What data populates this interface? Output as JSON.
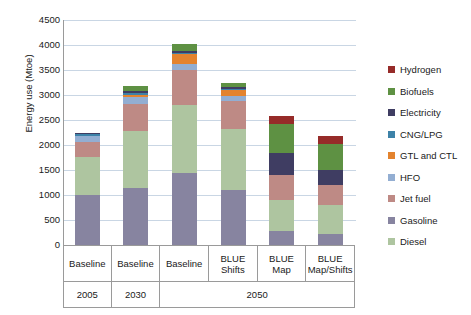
{
  "chart_data": {
    "type": "bar",
    "stacked": true,
    "title": "",
    "xlabel": "",
    "ylabel": "Energy use (Mtoe)",
    "ylim": [
      0,
      4500
    ],
    "ytick_step": 500,
    "yticks": [
      4500,
      4000,
      3500,
      3000,
      2500,
      2000,
      1500,
      1000,
      500,
      0
    ],
    "grid": true,
    "legend_position": "right",
    "categories": [
      "Baseline",
      "Baseline",
      "Baseline",
      "BLUE Shifts",
      "BLUE Map",
      "BLUE Map/Shifts"
    ],
    "category_lines": [
      [
        "Baseline"
      ],
      [
        "Baseline"
      ],
      [
        "Baseline"
      ],
      [
        "BLUE",
        "Shifts"
      ],
      [
        "BLUE",
        "Map"
      ],
      [
        "BLUE",
        "Map/Shifts"
      ]
    ],
    "group_labels": [
      {
        "label": "2005",
        "span": 1
      },
      {
        "label": "2030",
        "span": 1
      },
      {
        "label": "2050",
        "span": 4
      }
    ],
    "series": [
      {
        "name": "Diesel",
        "color": "#aec5a0",
        "values": [
          760,
          1130,
          1350,
          1220,
          610,
          570
        ]
      },
      {
        "name": "Gasoline",
        "color": "#8784a0",
        "values": [
          1000,
          1150,
          1450,
          1100,
          290,
          230
        ]
      },
      {
        "name": "Jet fuel",
        "color": "#be8a85",
        "values": [
          300,
          550,
          700,
          560,
          500,
          400
        ]
      },
      {
        "name": "HFO",
        "color": "#93aed2",
        "values": [
          130,
          130,
          120,
          110,
          0,
          0
        ]
      },
      {
        "name": "GTL and CTL",
        "color": "#e3832e",
        "values": [
          0,
          40,
          210,
          120,
          0,
          0
        ]
      },
      {
        "name": "CNG/LPG",
        "color": "#3d82a8",
        "values": [
          35,
          50,
          20,
          20,
          0,
          0
        ]
      },
      {
        "name": "Electricity",
        "color": "#3f3d62",
        "values": [
          20,
          35,
          40,
          40,
          450,
          300
        ]
      },
      {
        "name": "Biofuels",
        "color": "#5e9143",
        "values": [
          0,
          105,
          130,
          80,
          580,
          530
        ]
      },
      {
        "name": "Hydrogen",
        "color": "#962b29",
        "values": [
          0,
          0,
          0,
          0,
          150,
          150
        ]
      }
    ],
    "totals": [
      2245,
      3190,
      4020,
      3250,
      2580,
      2180
    ],
    "stack_order_bottom_to_top": [
      "Gasoline",
      "Diesel",
      "Jet fuel",
      "HFO",
      "GTL and CTL",
      "CNG/LPG",
      "Electricity",
      "Biofuels",
      "Hydrogen"
    ],
    "legend_entries": [
      {
        "label": "Hydrogen",
        "color": "#962b29"
      },
      {
        "label": "Biofuels",
        "color": "#5e9143"
      },
      {
        "label": "Electricity",
        "color": "#3f3d62"
      },
      {
        "label": "CNG/LPG",
        "color": "#3d82a8"
      },
      {
        "label": "GTL and CTL",
        "color": "#e3832e"
      },
      {
        "label": "HFO",
        "color": "#93aed2"
      },
      {
        "label": "Jet fuel",
        "color": "#be8a85"
      },
      {
        "label": "Gasoline",
        "color": "#8784a0"
      },
      {
        "label": "Diesel",
        "color": "#aec5a0"
      }
    ]
  }
}
